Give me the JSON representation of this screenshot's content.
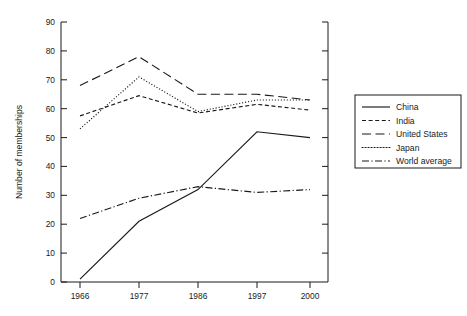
{
  "chart_data": {
    "type": "line",
    "title": "",
    "xlabel": "",
    "ylabel": "Number of memberships",
    "categories": [
      "1966",
      "1977",
      "1986",
      "1997",
      "2000"
    ],
    "x": [
      1966,
      1977,
      1986,
      1997,
      2000
    ],
    "ylim": [
      0,
      90
    ],
    "yticks": [
      0,
      10,
      20,
      30,
      40,
      50,
      60,
      70,
      80,
      90
    ],
    "ytick_labels": [
      "0",
      "10",
      "20",
      "30",
      "40",
      "50",
      "60",
      "70",
      "80",
      "90"
    ],
    "xtick_labels": [
      "1966",
      "1977",
      "1986",
      "1997",
      "2000"
    ],
    "grid": false,
    "legend_position": "right",
    "series": [
      {
        "name": "China",
        "style": "solid",
        "color": "#1a1a1a",
        "values": [
          1,
          21,
          32,
          52,
          50
        ]
      },
      {
        "name": "India",
        "style": "dashed",
        "color": "#1a1a1a",
        "values": [
          57.5,
          64.5,
          58.5,
          61.5,
          59.5
        ]
      },
      {
        "name": "United States",
        "style": "long-dash",
        "color": "#1a1a1a",
        "values": [
          68,
          78,
          65,
          65,
          63
        ]
      },
      {
        "name": "Japan",
        "style": "dotted",
        "color": "#1a1a1a",
        "values": [
          53,
          71,
          59,
          63,
          63
        ]
      },
      {
        "name": "World average",
        "style": "dash-dot",
        "color": "#1a1a1a",
        "values": [
          22,
          29,
          33,
          31,
          32
        ]
      }
    ]
  },
  "axes": {
    "y_axis_title": "Number of memberships",
    "y_tick_labels": [
      "90",
      "80",
      "70",
      "60",
      "50",
      "40",
      "30",
      "20",
      "10",
      "0"
    ],
    "x_tick_labels": [
      "1966",
      "1977",
      "1986",
      "1997",
      "2000"
    ]
  },
  "legend": {
    "entries": [
      {
        "label": "China",
        "style": "solid"
      },
      {
        "label": "India",
        "style": "dashed"
      },
      {
        "label": "United States",
        "style": "long-dash"
      },
      {
        "label": "Japan",
        "style": "dotted"
      },
      {
        "label": "World average",
        "style": "dash-dot"
      }
    ]
  }
}
